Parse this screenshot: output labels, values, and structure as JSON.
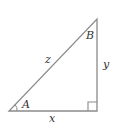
{
  "diagram": {
    "type": "right-triangle",
    "stroke_color": "#8a8a8a",
    "label_color": "#333333",
    "vertices": {
      "bottom_left": [
        9,
        111
      ],
      "bottom_right": [
        97,
        111
      ],
      "top": [
        97,
        19
      ]
    },
    "labels": {
      "angle_a": "A",
      "angle_b": "B",
      "hypotenuse": "z",
      "vertical_side": "y",
      "horizontal_side": "x"
    }
  }
}
